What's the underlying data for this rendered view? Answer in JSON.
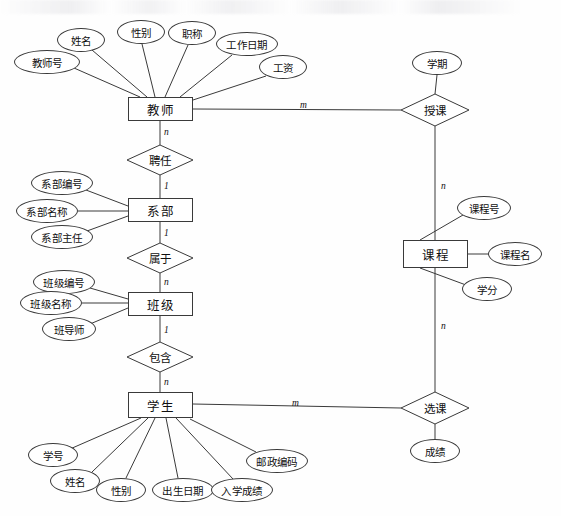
{
  "diagram": {
    "kind": "er-diagram",
    "title": "",
    "stroke_color": "#3a3a3a",
    "background_color": "#fefefe",
    "entities": [
      {
        "id": "teacher",
        "label": "教师",
        "x": 128,
        "y": 97,
        "w": 65,
        "h": 24
      },
      {
        "id": "department",
        "label": "系部",
        "x": 128,
        "y": 198,
        "w": 65,
        "h": 24
      },
      {
        "id": "class",
        "label": "班级",
        "x": 128,
        "y": 292,
        "w": 65,
        "h": 24
      },
      {
        "id": "student",
        "label": "学生",
        "x": 128,
        "y": 392,
        "w": 65,
        "h": 26
      },
      {
        "id": "course",
        "label": "课程",
        "x": 403,
        "y": 240,
        "w": 65,
        "h": 28
      }
    ],
    "relationships": [
      {
        "id": "employ",
        "label": "聘任",
        "cx": 160,
        "cy": 160,
        "rx": 33,
        "ry": 15
      },
      {
        "id": "belong",
        "label": "属于",
        "cx": 160,
        "cy": 258,
        "rx": 33,
        "ry": 15
      },
      {
        "id": "contain",
        "label": "包含",
        "cx": 160,
        "cy": 357,
        "rx": 33,
        "ry": 15
      },
      {
        "id": "teach",
        "label": "授课",
        "cx": 435,
        "cy": 110,
        "rx": 34,
        "ry": 16
      },
      {
        "id": "select",
        "label": "选课",
        "cx": 435,
        "cy": 408,
        "rx": 34,
        "ry": 16
      }
    ],
    "attributes": [
      {
        "id": "teacher-no",
        "label": "教师号",
        "owner": "teacher",
        "cx": 47,
        "cy": 62,
        "rx": 33,
        "ry": 12
      },
      {
        "id": "teacher-name",
        "label": "姓名",
        "owner": "teacher",
        "cx": 81,
        "cy": 40,
        "rx": 24,
        "ry": 12
      },
      {
        "id": "teacher-gender",
        "label": "性别",
        "owner": "teacher",
        "cx": 141,
        "cy": 32,
        "rx": 24,
        "ry": 12
      },
      {
        "id": "teacher-title",
        "label": "职称",
        "owner": "teacher",
        "cx": 192,
        "cy": 33,
        "rx": 24,
        "ry": 12
      },
      {
        "id": "teacher-workdate",
        "label": "工作日期",
        "owner": "teacher",
        "cx": 247,
        "cy": 44,
        "rx": 31,
        "ry": 12
      },
      {
        "id": "teacher-salary",
        "label": "工资",
        "owner": "teacher",
        "cx": 283,
        "cy": 67,
        "rx": 24,
        "ry": 12
      },
      {
        "id": "dept-no",
        "label": "系部编号",
        "owner": "department",
        "cx": 62,
        "cy": 183,
        "rx": 31,
        "ry": 12
      },
      {
        "id": "dept-name",
        "label": "系部名称",
        "owner": "department",
        "cx": 47,
        "cy": 211,
        "rx": 31,
        "ry": 12
      },
      {
        "id": "dept-head",
        "label": "系部主任",
        "owner": "department",
        "cx": 62,
        "cy": 237,
        "rx": 31,
        "ry": 12
      },
      {
        "id": "class-no",
        "label": "班级编号",
        "owner": "class",
        "cx": 64,
        "cy": 282,
        "rx": 31,
        "ry": 12
      },
      {
        "id": "class-name",
        "label": "班级名称",
        "owner": "class",
        "cx": 51,
        "cy": 303,
        "rx": 31,
        "ry": 12
      },
      {
        "id": "class-advisor",
        "label": "班导师",
        "owner": "class",
        "cx": 69,
        "cy": 329,
        "rx": 27,
        "ry": 12
      },
      {
        "id": "student-no",
        "label": "学号",
        "owner": "student",
        "cx": 53,
        "cy": 455,
        "rx": 25,
        "ry": 12
      },
      {
        "id": "student-name",
        "label": "姓名",
        "owner": "student",
        "cx": 75,
        "cy": 481,
        "rx": 25,
        "ry": 12
      },
      {
        "id": "student-gender",
        "label": "性别",
        "owner": "student",
        "cx": 121,
        "cy": 490,
        "rx": 25,
        "ry": 12
      },
      {
        "id": "student-birth",
        "label": "出生日期",
        "owner": "student",
        "cx": 183,
        "cy": 490,
        "rx": 31,
        "ry": 12
      },
      {
        "id": "student-score",
        "label": "入学成绩",
        "owner": "student",
        "cx": 242,
        "cy": 490,
        "rx": 31,
        "ry": 12
      },
      {
        "id": "student-zip",
        "label": "邮政编码",
        "owner": "student",
        "cx": 277,
        "cy": 461,
        "rx": 31,
        "ry": 12
      },
      {
        "id": "course-no",
        "label": "课程号",
        "owner": "course",
        "cx": 484,
        "cy": 208,
        "rx": 27,
        "ry": 12
      },
      {
        "id": "course-name",
        "label": "课程名",
        "owner": "course",
        "cx": 515,
        "cy": 254,
        "rx": 27,
        "ry": 12
      },
      {
        "id": "course-credit",
        "label": "学分",
        "owner": "course",
        "cx": 487,
        "cy": 289,
        "rx": 25,
        "ry": 12
      },
      {
        "id": "term",
        "label": "学期",
        "owner": "teach",
        "cx": 437,
        "cy": 63,
        "rx": 25,
        "ry": 12
      },
      {
        "id": "grade",
        "label": "成绩",
        "owner": "select",
        "cx": 435,
        "cy": 451,
        "rx": 25,
        "ry": 12
      }
    ],
    "cardinalities": [
      {
        "id": "card-teacher-employ",
        "text": "n",
        "x": 164,
        "y": 127
      },
      {
        "id": "card-employ-dept",
        "text": "1",
        "x": 164,
        "y": 181
      },
      {
        "id": "card-dept-belong",
        "text": "1",
        "x": 164,
        "y": 228
      },
      {
        "id": "card-belong-class",
        "text": "n",
        "x": 164,
        "y": 277
      },
      {
        "id": "card-class-contain",
        "text": "1",
        "x": 164,
        "y": 325
      },
      {
        "id": "card-contain-student",
        "text": "n",
        "x": 164,
        "y": 377
      },
      {
        "id": "card-teacher-teach",
        "text": "m",
        "x": 300,
        "y": 100
      },
      {
        "id": "card-teach-course",
        "text": "n",
        "x": 441,
        "y": 181
      },
      {
        "id": "card-course-select",
        "text": "n",
        "x": 441,
        "y": 321
      },
      {
        "id": "card-student-select",
        "text": "m",
        "x": 292,
        "y": 398
      }
    ],
    "connectors": [
      {
        "id": "link-teacherno-teacher",
        "x1": 74,
        "y1": 68,
        "x2": 140,
        "y2": 97
      },
      {
        "id": "link-teachername-teacher",
        "x1": 92,
        "y1": 50,
        "x2": 147,
        "y2": 97
      },
      {
        "id": "link-gender-teacher",
        "x1": 142,
        "y1": 44,
        "x2": 155,
        "y2": 97
      },
      {
        "id": "link-title-teacher",
        "x1": 188,
        "y1": 45,
        "x2": 165,
        "y2": 97
      },
      {
        "id": "link-workdate-teacher",
        "x1": 232,
        "y1": 55,
        "x2": 180,
        "y2": 97
      },
      {
        "id": "link-salary-teacher",
        "x1": 266,
        "y1": 76,
        "x2": 193,
        "y2": 100
      },
      {
        "id": "link-teacher-employ",
        "x1": 160,
        "y1": 121,
        "x2": 160,
        "y2": 145
      },
      {
        "id": "link-employ-dept",
        "x1": 160,
        "y1": 175,
        "x2": 160,
        "y2": 198
      },
      {
        "id": "link-deptno-dept",
        "x1": 86,
        "y1": 190,
        "x2": 128,
        "y2": 206
      },
      {
        "id": "link-deptname-dept",
        "x1": 78,
        "y1": 211,
        "x2": 128,
        "y2": 211
      },
      {
        "id": "link-depthead-dept",
        "x1": 87,
        "y1": 231,
        "x2": 128,
        "y2": 216
      },
      {
        "id": "link-dept-belong",
        "x1": 160,
        "y1": 222,
        "x2": 160,
        "y2": 243
      },
      {
        "id": "link-belong-class",
        "x1": 160,
        "y1": 273,
        "x2": 160,
        "y2": 292
      },
      {
        "id": "link-classno-class",
        "x1": 90,
        "y1": 288,
        "x2": 128,
        "y2": 299
      },
      {
        "id": "link-classname-class",
        "x1": 82,
        "y1": 303,
        "x2": 128,
        "y2": 303
      },
      {
        "id": "link-advisor-class",
        "x1": 90,
        "y1": 324,
        "x2": 128,
        "y2": 308
      },
      {
        "id": "link-class-contain",
        "x1": 160,
        "y1": 316,
        "x2": 160,
        "y2": 342
      },
      {
        "id": "link-contain-student",
        "x1": 160,
        "y1": 372,
        "x2": 160,
        "y2": 392
      },
      {
        "id": "link-studentno-student",
        "x1": 70,
        "y1": 449,
        "x2": 141,
        "y2": 418
      },
      {
        "id": "link-studentname-student",
        "x1": 92,
        "y1": 472,
        "x2": 148,
        "y2": 418
      },
      {
        "id": "link-sgender-student",
        "x1": 126,
        "y1": 478,
        "x2": 155,
        "y2": 418
      },
      {
        "id": "link-birth-student",
        "x1": 178,
        "y1": 478,
        "x2": 166,
        "y2": 418
      },
      {
        "id": "link-escore-student",
        "x1": 233,
        "y1": 479,
        "x2": 176,
        "y2": 418
      },
      {
        "id": "link-zip-student",
        "x1": 256,
        "y1": 452,
        "x2": 190,
        "y2": 419
      },
      {
        "id": "link-teacher-teach",
        "x1": 193,
        "y1": 109,
        "x2": 401,
        "y2": 110
      },
      {
        "id": "link-term-teach",
        "x1": 437,
        "y1": 75,
        "x2": 435,
        "y2": 94
      },
      {
        "id": "link-teach-course",
        "x1": 435,
        "y1": 126,
        "x2": 435,
        "y2": 240
      },
      {
        "id": "link-courseno-course",
        "x1": 463,
        "y1": 215,
        "x2": 420,
        "y2": 240
      },
      {
        "id": "link-coursename-course",
        "x1": 488,
        "y1": 254,
        "x2": 468,
        "y2": 254
      },
      {
        "id": "link-credit-course",
        "x1": 466,
        "y1": 285,
        "x2": 420,
        "y2": 268
      },
      {
        "id": "link-course-select",
        "x1": 435,
        "y1": 268,
        "x2": 435,
        "y2": 392
      },
      {
        "id": "link-student-select",
        "x1": 193,
        "y1": 404,
        "x2": 401,
        "y2": 408
      },
      {
        "id": "link-select-grade",
        "x1": 435,
        "y1": 424,
        "x2": 435,
        "y2": 439
      }
    ]
  }
}
